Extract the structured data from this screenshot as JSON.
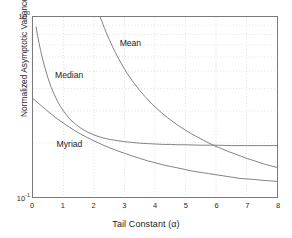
{
  "chart_data": {
    "type": "line",
    "title": "",
    "xlabel": "Tail Constant (α)",
    "ylabel": "Normalized Asymptotic Variance",
    "xlim": [
      0,
      8
    ],
    "ylim": [
      0.1,
      1.0
    ],
    "yscale": "log",
    "xscale": "linear",
    "grid": true,
    "legend": "inline-annotations",
    "xticks": [
      "0",
      "1",
      "2",
      "3",
      "4",
      "5",
      "6",
      "7",
      "8"
    ],
    "xtick_values": [
      0,
      1,
      2,
      3,
      4,
      5,
      6,
      7,
      8
    ],
    "ytick_labels": [
      "10",
      "10"
    ],
    "ytick_exponents": [
      "0",
      "-1"
    ],
    "ytick_values": [
      1.0,
      0.1
    ],
    "annotations": [
      {
        "text": "Mean",
        "x": 2.85,
        "y": 0.7
      },
      {
        "text": "Median",
        "x": 0.75,
        "y": 0.47
      },
      {
        "text": "Myriad",
        "x": 0.8,
        "y": 0.196
      }
    ],
    "series": [
      {
        "name": "Mean",
        "x": [
          2.2,
          2.25,
          2.3,
          2.35,
          2.4,
          2.5,
          2.6,
          2.7,
          2.8,
          2.9,
          3.0,
          3.1,
          3.2,
          3.3,
          3.4,
          3.5,
          3.6,
          3.7,
          3.8,
          3.9,
          4.0,
          4.2,
          4.4,
          4.6,
          4.8,
          5.0,
          5.2,
          5.4,
          5.6,
          5.8,
          6.0,
          6.2,
          6.4,
          6.6,
          6.8,
          7.0,
          7.2,
          7.4,
          7.6,
          7.8,
          8.0
        ],
        "y": [
          1.0,
          0.952,
          0.905,
          0.862,
          0.822,
          0.75,
          0.688,
          0.635,
          0.589,
          0.549,
          0.514,
          0.483,
          0.456,
          0.432,
          0.41,
          0.39,
          0.373,
          0.357,
          0.342,
          0.329,
          0.317,
          0.295,
          0.277,
          0.261,
          0.247,
          0.235,
          0.224,
          0.215,
          0.206,
          0.198,
          0.191,
          0.185,
          0.179,
          0.174,
          0.169,
          0.164,
          0.16,
          0.156,
          0.152,
          0.149,
          0.146
        ]
      },
      {
        "name": "Median",
        "x": [
          0.1,
          0.15,
          0.2,
          0.25,
          0.3,
          0.4,
          0.5,
          0.6,
          0.7,
          0.8,
          0.9,
          1.0,
          1.2,
          1.4,
          1.6,
          1.8,
          2.0,
          2.25,
          2.5,
          2.75,
          3.0,
          3.25,
          3.5,
          3.75,
          4.0,
          4.25,
          4.5,
          4.75,
          5.0,
          5.5,
          6.0,
          6.5,
          7.0,
          7.5,
          8.0
        ],
        "y": [
          0.88,
          0.79,
          0.714,
          0.651,
          0.598,
          0.515,
          0.453,
          0.406,
          0.37,
          0.341,
          0.318,
          0.3,
          0.272,
          0.253,
          0.239,
          0.229,
          0.221,
          0.214,
          0.209,
          0.206,
          0.203,
          0.201,
          0.199,
          0.198,
          0.197,
          0.196,
          0.196,
          0.195,
          0.195,
          0.194,
          0.194,
          0.193,
          0.193,
          0.193,
          0.193
        ]
      },
      {
        "name": "Myriad",
        "x": [
          0.0,
          0.1,
          0.2,
          0.3,
          0.4,
          0.5,
          0.6,
          0.7,
          0.8,
          0.9,
          1.0,
          1.2,
          1.4,
          1.6,
          1.8,
          2.0,
          2.25,
          2.5,
          2.75,
          3.0,
          3.25,
          3.5,
          3.75,
          4.0,
          4.25,
          4.5,
          4.75,
          5.0,
          5.25,
          5.5,
          5.75,
          6.0,
          6.25,
          6.5,
          6.75,
          7.0,
          7.25,
          7.5,
          7.75,
          8.0
        ],
        "y": [
          0.352,
          0.34,
          0.329,
          0.318,
          0.308,
          0.298,
          0.289,
          0.28,
          0.272,
          0.264,
          0.257,
          0.244,
          0.232,
          0.222,
          0.213,
          0.205,
          0.196,
          0.188,
          0.181,
          0.175,
          0.169,
          0.164,
          0.159,
          0.155,
          0.151,
          0.148,
          0.145,
          0.142,
          0.139,
          0.137,
          0.135,
          0.133,
          0.131,
          0.129,
          0.127,
          0.126,
          0.125,
          0.124,
          0.123,
          0.122
        ]
      }
    ]
  }
}
